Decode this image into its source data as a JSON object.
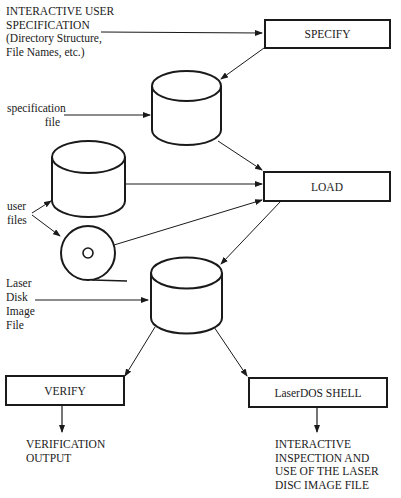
{
  "diagram": {
    "type": "flowchart",
    "nodes": {
      "specify": {
        "label": "SPECIFY",
        "shape": "process-box"
      },
      "load": {
        "label": "LOAD",
        "shape": "process-box"
      },
      "verify": {
        "label": "VERIFY",
        "shape": "process-box"
      },
      "shell": {
        "label": "LaserDOS SHELL",
        "shape": "process-box"
      },
      "spec_file": {
        "shape": "cylinder"
      },
      "user_disk": {
        "shape": "cylinder"
      },
      "user_tape": {
        "shape": "tape-reel"
      },
      "image_file": {
        "shape": "cylinder"
      }
    },
    "labels": {
      "interactive_spec": [
        "INTERACTIVE USER",
        "SPECIFICATION",
        "(Directory Structure,",
        "File Names, etc.)"
      ],
      "spec_file": [
        "specification",
        "file"
      ],
      "user_files": [
        "user",
        "files"
      ],
      "image_file": [
        "Laser",
        "Disk",
        "Image",
        "File"
      ],
      "verify_output": [
        "VERIFICATION",
        "OUTPUT"
      ],
      "shell_output": [
        "INTERACTIVE",
        "INSPECTION AND",
        "USE OF THE LASER",
        "DISC IMAGE FILE"
      ]
    },
    "edges": [
      {
        "from": "interactive_spec",
        "to": "specify"
      },
      {
        "from": "specify",
        "to": "spec_file"
      },
      {
        "from": "spec_file",
        "to": "load"
      },
      {
        "from": "user_disk",
        "to": "load"
      },
      {
        "from": "user_tape",
        "to": "load"
      },
      {
        "from": "user_files",
        "to": "user_disk"
      },
      {
        "from": "user_files",
        "to": "user_tape"
      },
      {
        "from": "load",
        "to": "image_file"
      },
      {
        "from": "image_file",
        "to": "verify"
      },
      {
        "from": "image_file",
        "to": "shell"
      },
      {
        "from": "verify",
        "to": "verify_output"
      },
      {
        "from": "shell",
        "to": "shell_output"
      }
    ]
  }
}
